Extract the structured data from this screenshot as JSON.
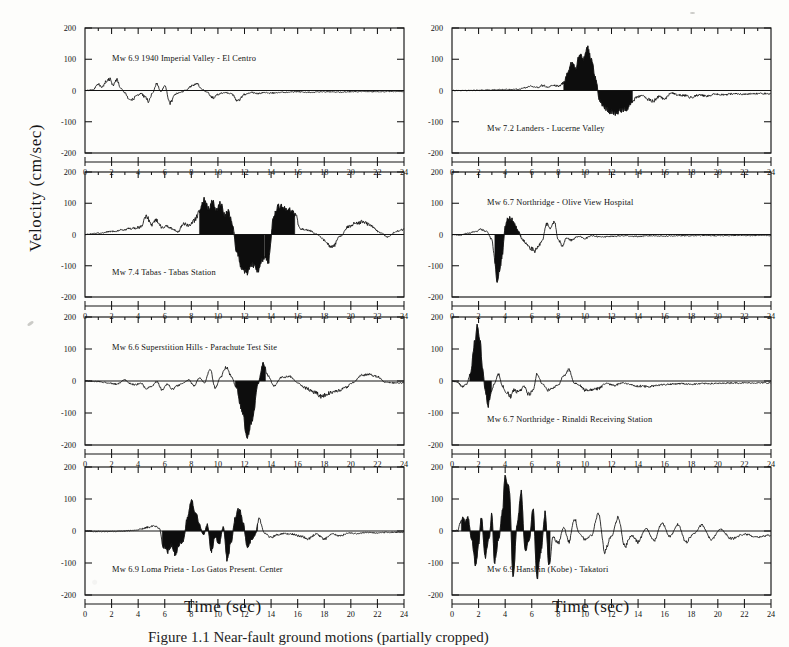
{
  "figure": {
    "ylabel": "Velocity (cm/sec)",
    "xlabel": "Time (sec)",
    "caption": "Figure 1.1  Near-fault ground motions (partially cropped)",
    "axis": {
      "ylim": [
        -200,
        200
      ],
      "yticks": [
        "200",
        "100",
        "0",
        "-100",
        "-200"
      ],
      "xlim": [
        0,
        24
      ],
      "xticks": [
        "0",
        "2",
        "4",
        "6",
        "8",
        "10",
        "12",
        "14",
        "16",
        "18",
        "20",
        "22",
        "24"
      ],
      "xminor_step": 1,
      "grid": false
    }
  },
  "chart_data": {
    "type": "line",
    "xlabel": "Time (sec)",
    "ylabel": "Velocity (cm/sec)",
    "xlim": [
      0,
      24
    ],
    "ylim": [
      -200,
      200
    ],
    "xticks": [
      0,
      2,
      4,
      6,
      8,
      10,
      12,
      14,
      16,
      18,
      20,
      22,
      24
    ],
    "yticks": [
      -200,
      -100,
      0,
      100,
      200
    ],
    "grid": false,
    "legend": "none",
    "panel_layout": {
      "rows": 4,
      "cols": 2,
      "order": "column-major"
    },
    "panels": [
      {
        "id": "imperial-valley-el-centro",
        "row": 1,
        "col": 1,
        "title": "Mw 6.9 1940 Imperial Valley - El Centro",
        "magnitude": 6.9,
        "event": "1940 Imperial Valley",
        "station": "El Centro",
        "peak_velocity_positive": 38,
        "peak_velocity_negative": -42,
        "pulse_shaded": false,
        "x": [
          0,
          0.6,
          1.0,
          1.3,
          1.6,
          1.9,
          2.1,
          2.4,
          2.7,
          3.0,
          3.3,
          3.6,
          3.9,
          4.2,
          4.5,
          4.8,
          5.1,
          5.4,
          5.7,
          6.0,
          6.4,
          6.8,
          7.2,
          7.6,
          8.0,
          8.4,
          8.8,
          9.2,
          9.6,
          10.0,
          10.5,
          11.0,
          11.5,
          12.0,
          12.5,
          13.0,
          13.5,
          14.0,
          15.0,
          16.0,
          17.0,
          18.0,
          19.0,
          20.0,
          21.0,
          22.0,
          23.0,
          24.0
        ],
        "y": [
          0,
          2,
          20,
          10,
          30,
          36,
          16,
          34,
          6,
          -8,
          -24,
          -28,
          -16,
          -10,
          -20,
          -34,
          -6,
          22,
          -4,
          14,
          -40,
          -12,
          -6,
          2,
          14,
          22,
          4,
          -6,
          -24,
          -12,
          -6,
          -10,
          -32,
          -12,
          -6,
          -10,
          -6,
          -8,
          -6,
          -4,
          -6,
          -4,
          -5,
          -4,
          -3,
          -4,
          -3,
          -3
        ]
      },
      {
        "id": "tabas-tabas-station",
        "row": 2,
        "col": 1,
        "title": "Mw 7.4 Tabas - Tabas Station",
        "magnitude": 7.4,
        "event": "Tabas",
        "station": "Tabas Station",
        "peak_velocity_positive": 112,
        "peak_velocity_negative": -122,
        "pulse_shaded": true,
        "shaded_intervals": [
          [
            8.6,
            11.2
          ],
          [
            11.2,
            13.5
          ],
          [
            13.5,
            15.8
          ]
        ],
        "x": [
          0,
          1,
          2,
          3,
          3.6,
          4.2,
          4.6,
          5.0,
          5.4,
          5.8,
          6.2,
          6.6,
          7.0,
          7.4,
          7.8,
          8.2,
          8.6,
          9.0,
          9.3,
          9.6,
          9.9,
          10.2,
          10.5,
          10.8,
          11.1,
          11.4,
          11.8,
          12.2,
          12.6,
          13.0,
          13.4,
          13.8,
          14.2,
          14.6,
          15.0,
          15.4,
          15.8,
          16.2,
          16.8,
          17.4,
          18.0,
          18.6,
          19.2,
          19.8,
          20.4,
          21.0,
          21.6,
          22.2,
          22.8,
          23.4,
          24.0
        ],
        "y": [
          0,
          4,
          10,
          16,
          20,
          24,
          60,
          30,
          46,
          22,
          26,
          18,
          8,
          36,
          30,
          44,
          70,
          112,
          82,
          104,
          78,
          98,
          60,
          74,
          30,
          -56,
          -108,
          -122,
          -96,
          -114,
          -78,
          -86,
          60,
          92,
          86,
          78,
          66,
          18,
          14,
          2,
          -18,
          -42,
          -6,
          24,
          38,
          40,
          26,
          6,
          -8,
          10,
          16
        ]
      },
      {
        "id": "superstition-hills-parachute-test-site",
        "row": 3,
        "col": 1,
        "title": "Mw 6.6 Superstition Hills - Parachute Test Site",
        "magnitude": 6.6,
        "event": "Superstition Hills",
        "station": "Parachute Test Site",
        "peak_velocity_positive": 52,
        "peak_velocity_negative": -172,
        "pulse_shaded": true,
        "shaded_intervals": [
          [
            11.3,
            13.6
          ]
        ],
        "x": [
          0,
          1,
          1.8,
          2.4,
          3.0,
          3.4,
          3.8,
          4.2,
          4.6,
          5.0,
          5.4,
          5.8,
          6.2,
          6.6,
          7.0,
          7.4,
          7.8,
          8.2,
          8.6,
          9.0,
          9.4,
          9.8,
          10.2,
          10.6,
          11.0,
          11.4,
          11.8,
          12.2,
          12.6,
          13.0,
          13.4,
          13.8,
          14.2,
          14.8,
          15.4,
          16.0,
          16.6,
          17.2,
          17.8,
          18.4,
          19.0,
          19.6,
          20.2,
          20.8,
          21.4,
          22.0,
          22.6,
          23.2,
          24.0
        ],
        "y": [
          0,
          -2,
          -6,
          -10,
          4,
          -8,
          -12,
          -6,
          -26,
          -16,
          -2,
          -28,
          -10,
          -24,
          -14,
          -6,
          4,
          -16,
          10,
          -6,
          38,
          -22,
          12,
          42,
          16,
          -22,
          -90,
          -172,
          -120,
          -10,
          52,
          16,
          -16,
          12,
          14,
          -6,
          -22,
          -34,
          -48,
          -38,
          -30,
          -20,
          -4,
          18,
          20,
          14,
          -4,
          -6,
          -6
        ]
      },
      {
        "id": "loma-prieta-los-gatos",
        "row": 4,
        "col": 1,
        "title": "Mw 6.9 Loma Prieta - Los Gatos Present. Center",
        "magnitude": 6.9,
        "event": "Loma Prieta",
        "station": "Los Gatos Present. Center",
        "peak_velocity_positive": 96,
        "peak_velocity_negative": -92,
        "pulse_shaded": true,
        "shaded_intervals": [
          [
            5.8,
            13.0
          ]
        ],
        "x": [
          0,
          1,
          2,
          3,
          3.6,
          4.2,
          4.8,
          5.2,
          5.6,
          5.9,
          6.2,
          6.5,
          6.8,
          7.1,
          7.4,
          7.7,
          8.0,
          8.3,
          8.6,
          8.9,
          9.2,
          9.5,
          9.8,
          10.1,
          10.4,
          10.7,
          11.0,
          11.3,
          11.6,
          11.9,
          12.2,
          12.5,
          12.8,
          13.1,
          13.5,
          14.0,
          14.5,
          15.0,
          15.6,
          16.2,
          16.8,
          17.4,
          18.0,
          18.6,
          19.2,
          19.8,
          20.5,
          21.2,
          22.0,
          23.0,
          24.0
        ],
        "y": [
          0,
          -2,
          -2,
          0,
          2,
          6,
          12,
          16,
          8,
          -48,
          -62,
          -44,
          -70,
          -40,
          -30,
          40,
          96,
          62,
          20,
          -12,
          20,
          -60,
          -18,
          -40,
          12,
          -88,
          -34,
          40,
          70,
          24,
          -50,
          -30,
          -12,
          36,
          -6,
          -20,
          -12,
          -8,
          -10,
          -16,
          -24,
          -10,
          -26,
          -8,
          -16,
          -6,
          -8,
          -4,
          -6,
          -4,
          -4
        ]
      },
      {
        "id": "landers-lucerne-valley",
        "row": 1,
        "col": 2,
        "title": "Mw 7.2 Landers - Lucerne Valley",
        "magnitude": 7.2,
        "event": "Landers",
        "station": "Lucerne Valley",
        "peak_velocity_positive": 134,
        "peak_velocity_negative": -72,
        "pulse_shaded": true,
        "shaded_intervals": [
          [
            8.4,
            13.6
          ]
        ],
        "x": [
          0,
          1,
          2,
          3,
          4,
          5,
          5.6,
          6.0,
          6.4,
          6.8,
          7.2,
          7.6,
          8.0,
          8.4,
          8.8,
          9.0,
          9.3,
          9.6,
          9.9,
          10.2,
          10.5,
          10.8,
          11.1,
          11.5,
          11.9,
          12.3,
          12.7,
          13.1,
          13.5,
          13.9,
          14.3,
          14.7,
          15.1,
          15.6,
          16.0,
          16.5,
          17.0,
          17.5,
          18.0,
          18.6,
          19.2,
          19.8,
          20.5,
          21.2,
          22.0,
          23.0,
          24.0
        ],
        "y": [
          0,
          0,
          1,
          2,
          3,
          4,
          10,
          14,
          10,
          16,
          12,
          18,
          14,
          24,
          66,
          90,
          74,
          110,
          104,
          134,
          96,
          40,
          -30,
          -56,
          -66,
          -72,
          -64,
          -58,
          -40,
          -22,
          -16,
          -28,
          -34,
          -20,
          -26,
          -8,
          -14,
          -16,
          -22,
          -14,
          -18,
          -12,
          -14,
          -10,
          -12,
          -10,
          -10
        ]
      },
      {
        "id": "northridge-olive-view",
        "row": 2,
        "col": 2,
        "title": "Mw 6.7 Northridge - Olive View Hospital",
        "magnitude": 6.7,
        "event": "Northridge",
        "station": "Olive View Hospital",
        "peak_velocity_positive": 54,
        "peak_velocity_negative": -150,
        "pulse_shaded": true,
        "shaded_intervals": [
          [
            3.2,
            5.2
          ]
        ],
        "x": [
          0,
          0.6,
          1.2,
          1.8,
          2.2,
          2.6,
          3.0,
          3.2,
          3.4,
          3.6,
          3.8,
          4.0,
          4.2,
          4.4,
          4.6,
          4.8,
          5.0,
          5.3,
          5.6,
          5.9,
          6.2,
          6.5,
          6.8,
          7.1,
          7.4,
          7.7,
          8.0,
          8.3,
          8.6,
          9.0,
          9.5,
          10.0,
          10.6,
          11.2,
          12.0,
          13.0,
          14.0,
          15.0,
          16.0,
          17.0,
          18.0,
          19.0,
          20.0,
          21.0,
          22.0,
          23.0,
          24.0
        ],
        "y": [
          0,
          -2,
          4,
          10,
          16,
          10,
          -16,
          -80,
          -150,
          -110,
          -60,
          24,
          54,
          50,
          44,
          24,
          10,
          -16,
          -30,
          -44,
          -52,
          -38,
          -18,
          34,
          20,
          40,
          -18,
          -34,
          -12,
          -18,
          -6,
          -12,
          -4,
          -8,
          -6,
          -4,
          -6,
          -4,
          -5,
          -4,
          -4,
          -3,
          -4,
          -3,
          -3,
          -3,
          -3
        ]
      },
      {
        "id": "northridge-rinaldi",
        "row": 3,
        "col": 2,
        "title": "Mw 6.7 Northridge - Rinaldi Receiving Station",
        "magnitude": 6.7,
        "event": "Northridge",
        "station": "Rinaldi Receiving Station",
        "peak_velocity_positive": 172,
        "peak_velocity_negative": -84,
        "pulse_shaded": true,
        "shaded_intervals": [
          [
            1.3,
            3.0
          ]
        ],
        "x": [
          0,
          0.4,
          0.8,
          1.1,
          1.4,
          1.7,
          1.9,
          2.1,
          2.3,
          2.5,
          2.7,
          2.9,
          3.2,
          3.5,
          3.8,
          4.1,
          4.4,
          4.7,
          5.0,
          5.4,
          5.8,
          6.1,
          6.4,
          6.8,
          7.2,
          7.6,
          8.0,
          8.4,
          8.8,
          9.2,
          9.6,
          10.0,
          10.5,
          11.0,
          11.6,
          12.2,
          12.8,
          13.4,
          14.0,
          14.8,
          15.6,
          16.4,
          17.2,
          18.0,
          19.0,
          20.0,
          21.0,
          22.0,
          23.0,
          24.0
        ],
        "y": [
          0,
          -4,
          -18,
          -10,
          24,
          120,
          172,
          130,
          40,
          -30,
          -84,
          -40,
          -8,
          22,
          -16,
          -34,
          -48,
          -28,
          -36,
          -18,
          -42,
          -30,
          24,
          -10,
          -28,
          -22,
          -12,
          16,
          36,
          -6,
          -14,
          -28,
          -30,
          -24,
          -8,
          -14,
          -6,
          -10,
          -16,
          -18,
          -12,
          -10,
          -8,
          -10,
          -8,
          -8,
          -6,
          -6,
          -6,
          -6
        ]
      },
      {
        "id": "hanshin-kobe-takatori",
        "row": 4,
        "col": 2,
        "title": "Mw 6.9 Hanshin (Kobe) - Takatori",
        "magnitude": 6.9,
        "event": "Hanshin (Kobe)",
        "station": "Takatori",
        "peak_velocity_positive": 174,
        "peak_velocity_negative": -148,
        "pulse_shaded": true,
        "shaded_intervals": [
          [
            0.7,
            7.4
          ]
        ],
        "x": [
          0,
          0.4,
          0.8,
          1.0,
          1.2,
          1.5,
          1.8,
          2.0,
          2.2,
          2.5,
          2.8,
          3.0,
          3.2,
          3.5,
          3.8,
          4.0,
          4.3,
          4.6,
          4.9,
          5.2,
          5.5,
          5.8,
          6.1,
          6.4,
          6.7,
          7.0,
          7.3,
          7.6,
          8.0,
          8.4,
          8.8,
          9.2,
          9.6,
          10.0,
          10.5,
          11.0,
          11.5,
          12.0,
          12.5,
          13.0,
          13.5,
          14.0,
          14.6,
          15.2,
          15.8,
          16.4,
          17.0,
          17.6,
          18.2,
          18.8,
          19.5,
          20.2,
          21.0,
          22.0,
          23.0,
          24.0
        ],
        "y": [
          0,
          2,
          44,
          30,
          40,
          -30,
          -110,
          -40,
          46,
          -78,
          -20,
          54,
          -100,
          -30,
          60,
          174,
          130,
          -140,
          20,
          120,
          -60,
          -30,
          64,
          -146,
          -60,
          56,
          -104,
          -20,
          -38,
          12,
          -34,
          40,
          -10,
          -26,
          -14,
          56,
          -62,
          -16,
          44,
          -48,
          -14,
          -34,
          8,
          -30,
          26,
          -18,
          20,
          -34,
          -8,
          18,
          -26,
          6,
          -24,
          -10,
          -18,
          -14
        ]
      }
    ]
  }
}
